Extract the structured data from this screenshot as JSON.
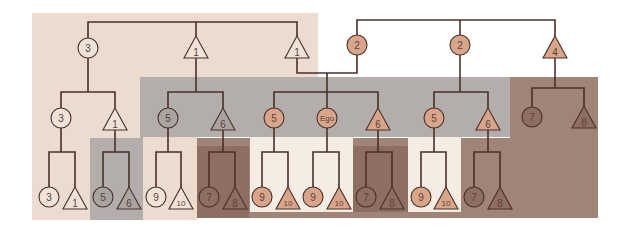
{
  "diagram": {
    "type": "kinship-chart",
    "colors": {
      "background": "#ffffff",
      "region_beige": "#ecdcd0",
      "region_gray": "#b3aeac",
      "region_brown": "#a08478",
      "region_cream": "#f5ece4",
      "node_salmon": "#d9a58a",
      "node_brown_fill": "#8e6e62",
      "node_gray_fill": "#a9a4a2",
      "node_beige_fill": "#efe2d8",
      "line": "#4a3028"
    },
    "nodes": [
      {
        "id": "g1_f",
        "shape": "circle",
        "label": "3",
        "x": 88,
        "y": 48,
        "fill": "beige"
      },
      {
        "id": "g1_m1",
        "shape": "triangle",
        "label": "1",
        "x": 196,
        "y": 48,
        "fill": "beige"
      },
      {
        "id": "g1_m2",
        "shape": "triangle",
        "label": "1",
        "x": 297,
        "y": 48,
        "fill": "beige"
      },
      {
        "id": "g1_f2",
        "shape": "circle",
        "label": "2",
        "x": 357,
        "y": 45,
        "fill": "salmon"
      },
      {
        "id": "g1_f3",
        "shape": "circle",
        "label": "2",
        "x": 460,
        "y": 45,
        "fill": "salmon"
      },
      {
        "id": "g1_m3",
        "shape": "triangle",
        "label": "4",
        "x": 555,
        "y": 48,
        "fill": "salmon"
      },
      {
        "id": "g2_1",
        "shape": "circle",
        "label": "3",
        "x": 61,
        "y": 118,
        "fill": "beige"
      },
      {
        "id": "g2_2",
        "shape": "triangle",
        "label": "1",
        "x": 115,
        "y": 120,
        "fill": "beige"
      },
      {
        "id": "g2_3",
        "shape": "circle",
        "label": "5",
        "x": 168,
        "y": 118,
        "fill": "gray"
      },
      {
        "id": "g2_4",
        "shape": "triangle",
        "label": "6",
        "x": 223,
        "y": 120,
        "fill": "gray"
      },
      {
        "id": "g2_5",
        "shape": "circle",
        "label": "5",
        "x": 274,
        "y": 118,
        "fill": "salmon"
      },
      {
        "id": "g2_ego",
        "shape": "circle",
        "label": "Ego",
        "x": 327,
        "y": 118,
        "fill": "salmon"
      },
      {
        "id": "g2_6",
        "shape": "triangle",
        "label": "6",
        "x": 378,
        "y": 120,
        "fill": "salmon"
      },
      {
        "id": "g2_7",
        "shape": "circle",
        "label": "5",
        "x": 434,
        "y": 118,
        "fill": "salmon"
      },
      {
        "id": "g2_8",
        "shape": "triangle",
        "label": "6",
        "x": 488,
        "y": 120,
        "fill": "salmon"
      },
      {
        "id": "g2_9",
        "shape": "circle",
        "label": "7",
        "x": 532,
        "y": 117,
        "fill": "brown"
      },
      {
        "id": "g2_10",
        "shape": "triangle",
        "label": "8",
        "x": 584,
        "y": 118,
        "fill": "brown"
      },
      {
        "id": "g3_1",
        "shape": "circle",
        "label": "3",
        "x": 49,
        "y": 197,
        "fill": "beige"
      },
      {
        "id": "g3_2",
        "shape": "triangle",
        "label": "1",
        "x": 75,
        "y": 199,
        "fill": "beige"
      },
      {
        "id": "g3_3",
        "shape": "circle",
        "label": "5",
        "x": 103,
        "y": 197,
        "fill": "gray"
      },
      {
        "id": "g3_4",
        "shape": "triangle",
        "label": "6",
        "x": 129,
        "y": 199,
        "fill": "gray"
      },
      {
        "id": "g3_5",
        "shape": "circle",
        "label": "9",
        "x": 156,
        "y": 197,
        "fill": "beige"
      },
      {
        "id": "g3_6",
        "shape": "triangle",
        "label": "10",
        "x": 181,
        "y": 199,
        "fill": "beige"
      },
      {
        "id": "g3_7",
        "shape": "circle",
        "label": "7",
        "x": 209,
        "y": 197,
        "fill": "brown"
      },
      {
        "id": "g3_8",
        "shape": "triangle",
        "label": "8",
        "x": 235,
        "y": 199,
        "fill": "brown"
      },
      {
        "id": "g3_9",
        "shape": "circle",
        "label": "9",
        "x": 262,
        "y": 197,
        "fill": "salmon"
      },
      {
        "id": "g3_10",
        "shape": "triangle",
        "label": "10",
        "x": 288,
        "y": 199,
        "fill": "salmon"
      },
      {
        "id": "g3_11",
        "shape": "circle",
        "label": "9",
        "x": 313,
        "y": 197,
        "fill": "salmon"
      },
      {
        "id": "g3_12",
        "shape": "triangle",
        "label": "10",
        "x": 339,
        "y": 199,
        "fill": "salmon"
      },
      {
        "id": "g3_13",
        "shape": "circle",
        "label": "7",
        "x": 366,
        "y": 197,
        "fill": "brown"
      },
      {
        "id": "g3_14",
        "shape": "triangle",
        "label": "8",
        "x": 392,
        "y": 199,
        "fill": "brown"
      },
      {
        "id": "g3_15",
        "shape": "circle",
        "label": "9",
        "x": 421,
        "y": 197,
        "fill": "salmon"
      },
      {
        "id": "g3_16",
        "shape": "triangle",
        "label": "10",
        "x": 446,
        "y": 199,
        "fill": "salmon"
      },
      {
        "id": "g3_17",
        "shape": "circle",
        "label": "7",
        "x": 474,
        "y": 197,
        "fill": "brown"
      },
      {
        "id": "g3_18",
        "shape": "triangle",
        "label": "8",
        "x": 500,
        "y": 199,
        "fill": "brown"
      }
    ]
  }
}
